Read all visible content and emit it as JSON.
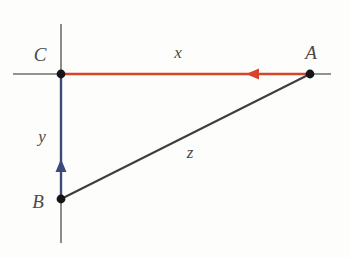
{
  "figure": {
    "background_color": "#fdfdfb",
    "canvas": {
      "width": 349,
      "height": 258
    }
  },
  "axes": {
    "horizontal": {
      "name": "horizontal-axis",
      "color": "#6f6f6f",
      "x1": 13,
      "y1": 74,
      "x2": 331,
      "y2": 74
    },
    "vertical": {
      "name": "vertical-axis",
      "color": "#6f6f6f",
      "x1": 61,
      "y1": 24,
      "x2": 61,
      "y2": 243
    }
  },
  "vertices": [
    {
      "id": "C",
      "label": "C",
      "x": 61,
      "y": 74,
      "label_x": 40,
      "label_y": 61
    },
    {
      "id": "A",
      "label": "A",
      "x": 310,
      "y": 74,
      "label_x": 311,
      "label_y": 59
    },
    {
      "id": "B",
      "label": "B",
      "x": 61,
      "y": 199,
      "label_x": 38,
      "label_y": 208
    }
  ],
  "segments": [
    {
      "id": "x",
      "label": "x",
      "description": "vector from A to C along horizontal",
      "color": "#d6452a",
      "from": "A",
      "to": "C",
      "x1": 310,
      "y1": 74,
      "x2": 61,
      "y2": 74,
      "arrow": {
        "direction": "left",
        "tip_x": 246,
        "tip_y": 74
      },
      "label_x": 178,
      "label_y": 58
    },
    {
      "id": "y",
      "label": "y",
      "description": "vector from B to C along vertical",
      "color": "#3a4a7a",
      "from": "B",
      "to": "C",
      "x1": 61,
      "y1": 199,
      "x2": 61,
      "y2": 74,
      "arrow": {
        "direction": "up",
        "tip_x": 61,
        "tip_y": 159
      },
      "label_x": 42,
      "label_y": 142
    },
    {
      "id": "z",
      "label": "z",
      "description": "hypotenuse from B to A",
      "color": "#3d3d42",
      "from": "B",
      "to": "A",
      "x1": 61,
      "y1": 199,
      "x2": 310,
      "y2": 74,
      "arrow": null,
      "label_x": 190,
      "label_y": 158
    }
  ],
  "colors": {
    "red": "#d6452a",
    "blue": "#3a4a7a",
    "dark": "#3d3d42",
    "axis_gray": "#6f6f6f",
    "label_gray": "#4a4a4a"
  }
}
